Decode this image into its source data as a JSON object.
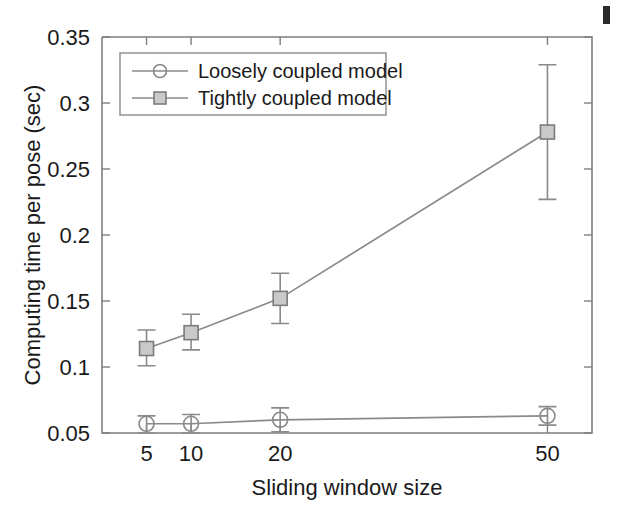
{
  "chart_data": {
    "type": "line",
    "title": "",
    "xlabel": "Sliding window size",
    "ylabel": "Computing time per pose (sec)",
    "x": [
      5,
      10,
      20,
      50
    ],
    "categories": [
      "5",
      "10",
      "20",
      "50"
    ],
    "xtick_labels": [
      "5",
      "10",
      "20",
      "50"
    ],
    "ytick_labels": [
      "0.05",
      "0.1",
      "0.15",
      "0.2",
      "0.25",
      "0.3",
      "0.35"
    ],
    "ytick_values": [
      0.05,
      0.1,
      0.15,
      0.2,
      0.25,
      0.3,
      0.35
    ],
    "ylim": [
      0.05,
      0.35
    ],
    "xlim": [
      0,
      55
    ],
    "grid": false,
    "legend_position": "upper-left-inside",
    "series": [
      {
        "name": "Loosely coupled model",
        "marker": "circle",
        "color": "#8a8a8a",
        "values": [
          0.057,
          0.057,
          0.06,
          0.063
        ],
        "err_low": [
          0.05,
          0.05,
          0.051,
          0.056
        ],
        "err_high": [
          0.063,
          0.064,
          0.069,
          0.07
        ]
      },
      {
        "name": "Tightly coupled model",
        "marker": "square",
        "color": "#8a8a8a",
        "values": [
          0.114,
          0.126,
          0.152,
          0.278
        ],
        "err_low": [
          0.101,
          0.113,
          0.133,
          0.227
        ],
        "err_high": [
          0.128,
          0.14,
          0.171,
          0.329
        ]
      }
    ]
  },
  "legend": {
    "items": [
      {
        "label": "Loosely coupled model",
        "marker": "circle"
      },
      {
        "label": "Tightly coupled model",
        "marker": "square"
      }
    ]
  },
  "axes": {
    "x_title": "Sliding window size",
    "y_title": "Computing time per pose (sec)"
  }
}
